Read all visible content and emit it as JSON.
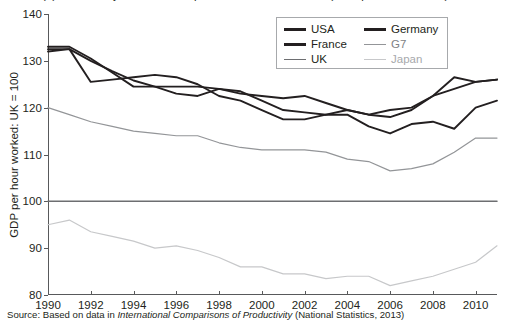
{
  "figure": {
    "title_clipped": "(b) Productivity in the UK compared with other countries (GDP per hour worked)",
    "source_prefix": "Source: Based on data in ",
    "source_italic": "International Comparisons of Productivity",
    "source_suffix": " (National Statistics, 2013)"
  },
  "legend": {
    "entries": [
      {
        "label": "USA",
        "color": "#231f20"
      },
      {
        "label": "Germany",
        "color": "#231f20"
      },
      {
        "label": "France",
        "color": "#231f20"
      },
      {
        "label": "G7",
        "color": "#939598"
      },
      {
        "label": "UK",
        "color": "#6d6e71"
      },
      {
        "label": "Japan",
        "color": "#c7c8ca"
      }
    ]
  },
  "chart_data": {
    "type": "line",
    "title": "(b) Productivity in the UK compared with other countries (GDP per hour worked)",
    "xlabel": "",
    "ylabel": "GDP per hour worked: UK = 100",
    "xlim": [
      1990,
      2011
    ],
    "ylim": [
      80,
      140
    ],
    "yticks": [
      80,
      90,
      100,
      110,
      120,
      130,
      140
    ],
    "xticks": [
      1990,
      1992,
      1994,
      1996,
      1998,
      2000,
      2002,
      2004,
      2006,
      2008,
      2010
    ],
    "xtick_labels": [
      "1990",
      "1992",
      "1994",
      "1996",
      "1998",
      "2000",
      "2002",
      "2004",
      "2006",
      "2008",
      "2010"
    ],
    "ytick_labels": [
      "80",
      "90",
      "100",
      "110",
      "120",
      "130",
      "140"
    ],
    "grid": false,
    "legend_position": "upper right",
    "x": [
      1990,
      1991,
      1992,
      1993,
      1994,
      1995,
      1996,
      1997,
      1998,
      1999,
      2000,
      2001,
      2002,
      2003,
      2004,
      2005,
      2006,
      2007,
      2008,
      2009,
      2010,
      2011
    ],
    "series": [
      {
        "name": "USA",
        "color": "#231f20",
        "values": [
          132.5,
          132.5,
          130.0,
          127.8,
          125.8,
          124.5,
          124.5,
          124.5,
          124.0,
          123.0,
          122.5,
          122.0,
          122.5,
          121.0,
          119.5,
          118.5,
          118.0,
          119.5,
          122.5,
          126.5,
          125.5,
          126.0
        ]
      },
      {
        "name": "France",
        "color": "#231f20",
        "values": [
          133.0,
          133.0,
          130.5,
          127.5,
          124.5,
          124.5,
          123.0,
          122.5,
          124.0,
          123.5,
          121.5,
          119.5,
          119.0,
          118.5,
          119.5,
          118.5,
          119.5,
          120.0,
          122.5,
          124.0,
          125.5,
          126.0
        ]
      },
      {
        "name": "Germany",
        "color": "#231f20",
        "values": [
          132.0,
          132.5,
          125.5,
          126.0,
          126.5,
          127.0,
          126.5,
          125.0,
          122.5,
          121.5,
          119.5,
          117.5,
          117.5,
          118.5,
          118.5,
          116.0,
          114.5,
          116.5,
          117.0,
          115.5,
          120.0,
          121.5
        ]
      },
      {
        "name": "UK",
        "color": "#6d6e71",
        "values": [
          100,
          100,
          100,
          100,
          100,
          100,
          100,
          100,
          100,
          100,
          100,
          100,
          100,
          100,
          100,
          100,
          100,
          100,
          100,
          100,
          100,
          100
        ]
      },
      {
        "name": "G7",
        "color": "#939598",
        "values": [
          120.0,
          118.5,
          117.0,
          116.0,
          115.0,
          114.5,
          114.0,
          114.0,
          112.5,
          111.5,
          111.0,
          111.0,
          111.0,
          110.5,
          109.0,
          108.5,
          106.5,
          107.0,
          108.0,
          110.5,
          113.5,
          113.5
        ]
      },
      {
        "name": "Japan",
        "color": "#c7c8ca",
        "values": [
          95.0,
          96.0,
          93.5,
          92.5,
          91.5,
          90.0,
          90.5,
          89.5,
          88.0,
          86.0,
          86.0,
          84.5,
          84.5,
          83.5,
          84.0,
          84.0,
          82.0,
          83.0,
          84.0,
          85.5,
          87.0,
          90.5
        ]
      }
    ]
  }
}
